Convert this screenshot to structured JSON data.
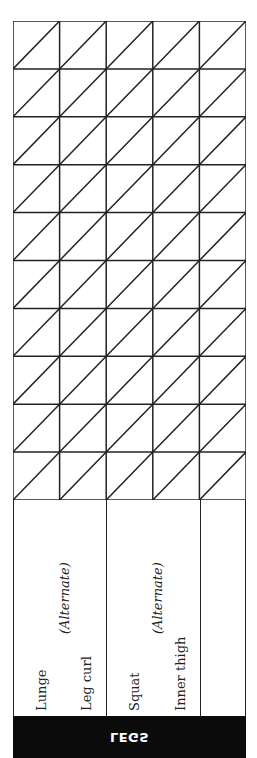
{
  "section": {
    "title": "LEGS",
    "band_color": "#0b0b0b",
    "line_color": "#222222"
  },
  "exercise_groups": [
    {
      "primary": "Lunge",
      "alternate_note": "(Alternate)",
      "secondary": "Leg curl"
    },
    {
      "primary": "Squat",
      "alternate_note": "(Alternate)",
      "secondary": "Inner thigh"
    },
    {
      "primary": "",
      "alternate_note": "",
      "secondary": ""
    }
  ],
  "log_grid": {
    "columns": 5,
    "rows": 10,
    "cell_style": "diagonal-split",
    "entries": []
  }
}
